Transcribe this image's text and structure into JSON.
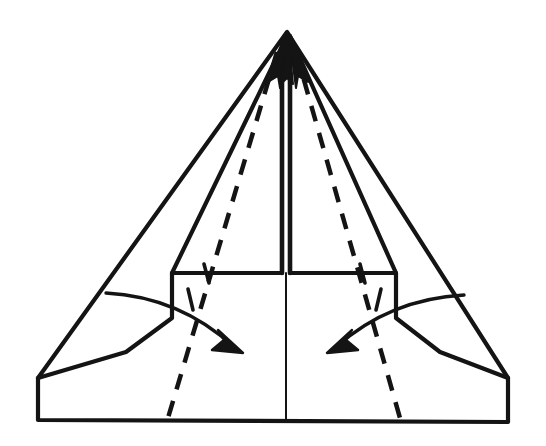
{
  "figure": {
    "kind": "origami-fold-instruction",
    "background_color": "#ffffff",
    "ink_color": "#141414",
    "canvas": {
      "width": 546,
      "height": 446
    }
  },
  "geometry": {
    "apex": {
      "x": 287,
      "y": 32
    },
    "outer_triangle": {
      "label": "outer-silhouette",
      "points": "287,32 38,378 38,420 508,422 508,378",
      "left_vertex": {
        "x": 38,
        "y": 378
      },
      "right_vertex": {
        "x": 508,
        "y": 378
      },
      "bottom_left": {
        "x": 38,
        "y": 420
      },
      "bottom_right": {
        "x": 508,
        "y": 422
      }
    },
    "inner_left_flap": {
      "label": "left-folded-flap",
      "points": "287,36 172,273 172,318 126,352 38,378"
    },
    "inner_right_flap": {
      "label": "right-folded-flap",
      "points": "290,36 396,273 396,318 440,352 508,378"
    },
    "center_spine_left": {
      "x1": 282,
      "y1": 40,
      "x2": 282,
      "y2": 273
    },
    "center_spine_right": {
      "x1": 290,
      "y1": 40,
      "x2": 290,
      "y2": 273
    },
    "center_lower_line": {
      "x1": 286,
      "y1": 273,
      "x2": 286,
      "y2": 421
    },
    "horizontal_left": {
      "x1": 172,
      "y1": 273,
      "x2": 282,
      "y2": 273
    },
    "horizontal_right": {
      "x1": 290,
      "y1": 273,
      "x2": 396,
      "y2": 273
    }
  },
  "fold_lines": [
    {
      "name": "left-valley-fold",
      "style": "dashed",
      "dash_pattern": "16 12",
      "stroke_width": 4.5,
      "path": "M 277,52 L 168,418"
    },
    {
      "name": "right-valley-fold",
      "style": "dashed",
      "dash_pattern": "16 12",
      "stroke_width": 4.5,
      "path": "M 296,52 L 400,418"
    }
  ],
  "arrows": [
    {
      "name": "left-fold-arrow",
      "direction": "down-right",
      "description": "Curved arrow indicating the left flap folds toward the lower right",
      "curve": "M 106,293 Q 180,297 234,347",
      "head_points": "243,353 212,350 224,340 218,330",
      "ticks": 2
    },
    {
      "name": "right-fold-arrow",
      "direction": "down-left",
      "description": "Curved arrow indicating the right flap folds toward the lower left",
      "curve": "M 464,295 Q 390,299 336,347",
      "head_points": "327,353 358,350 346,340 352,330",
      "ticks": 2
    }
  ],
  "tick_marks": [
    {
      "name": "tick-horizontal-left",
      "x1": 204,
      "y1": 264,
      "x2": 209,
      "y2": 283
    },
    {
      "name": "tick-horizontal-right",
      "x1": 360,
      "y1": 264,
      "x2": 365,
      "y2": 283
    },
    {
      "name": "tick-arrow-left",
      "x1": 188,
      "y1": 289,
      "x2": 193,
      "y2": 310
    },
    {
      "name": "tick-arrow-right",
      "x1": 381,
      "y1": 289,
      "x2": 376,
      "y2": 310
    }
  ],
  "apex_arrowheads": [
    {
      "name": "apex-arrowhead-left",
      "points": "287,36 268,82 278,76 280,88"
    },
    {
      "name": "apex-arrowhead-right",
      "points": "289,36 308,82 298,76 296,88"
    },
    {
      "name": "apex-arrowhead-center",
      "points": "288,34 281,84 287,78 293,84"
    }
  ]
}
